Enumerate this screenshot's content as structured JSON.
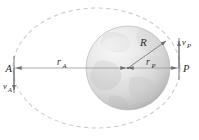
{
  "figure": {
    "colors": {
      "orbit_dash": "#c9c9cf",
      "axis_line": "#9a9a9a",
      "arrow": "#6e6e6e",
      "label_text": "#2b2b2b",
      "planet_light": "#e8e8e8",
      "planet_mid": "#d2d2d2",
      "planet_dark": "#b9b9b9",
      "planet_edge": "#a8a8a8",
      "background": "#ffffff"
    }
  },
  "labels": {
    "apoapsis_point": "A",
    "periapsis_point": "P",
    "apoapsis_radius": "r",
    "apoapsis_radius_sub": "A",
    "periapsis_radius": "r",
    "periapsis_radius_sub": "P",
    "planet_radius": "R",
    "apoapsis_velocity": "v",
    "apoapsis_velocity_sub": "A",
    "periapsis_velocity": "v",
    "periapsis_velocity_sub": "P"
  },
  "geometry": {
    "ellipse_center_x": 96.5,
    "ellipse_center_y": 68,
    "ellipse_rx": 83.5,
    "ellipse_ry": 60,
    "planet_center_x": 128,
    "planet_center_y": 68,
    "planet_radius": 42,
    "apoapsis_x": 13,
    "periapsis_x": 180,
    "axis_y": 68
  },
  "elements": {
    "orbit_path_name": "orbit-ellipse-dashed",
    "planet_name": "planet-sphere",
    "major_axis_name": "major-axis-line",
    "apoapsis_tangent_name": "apoapsis-tangent-line",
    "periapsis_tangent_name": "periapsis-tangent-line"
  }
}
